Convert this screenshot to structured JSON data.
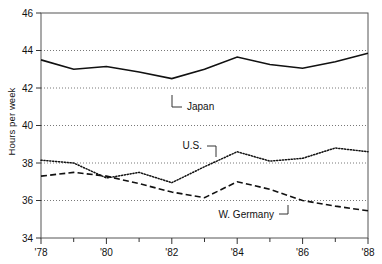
{
  "chart_data": {
    "type": "line",
    "title": "",
    "xlabel": "",
    "ylabel": "Hours per week",
    "xlim": [
      1978,
      1988
    ],
    "ylim": [
      34,
      46
    ],
    "yticks": [
      34,
      36,
      38,
      40,
      42,
      44,
      46
    ],
    "ytick_labels": [
      "34",
      "36",
      "38",
      "40",
      "42",
      "44",
      "46"
    ],
    "gridlines_y": [
      36,
      38,
      40,
      42,
      44
    ],
    "grid": "horizontal-dotted",
    "xticks": [
      1978,
      1979,
      1980,
      1981,
      1982,
      1983,
      1984,
      1985,
      1986,
      1987,
      1988
    ],
    "xtick_labels_shown": [
      "'78",
      "'80",
      "'82",
      "'84",
      "'86",
      "'88"
    ],
    "xtick_labeled_years": [
      1978,
      1980,
      1982,
      1984,
      1986,
      1988
    ],
    "legend_position": "inline-annotations",
    "series": [
      {
        "name": "Japan",
        "style": "solid",
        "x": [
          1978,
          1979,
          1980,
          1981,
          1982,
          1983,
          1984,
          1985,
          1986,
          1987,
          1988
        ],
        "values": [
          43.5,
          43.0,
          43.15,
          42.85,
          42.5,
          43.0,
          43.65,
          43.25,
          43.05,
          43.4,
          43.85
        ]
      },
      {
        "name": "U.S.",
        "style": "dotted",
        "x": [
          1978,
          1979,
          1980,
          1981,
          1982,
          1983,
          1984,
          1985,
          1986,
          1987,
          1988
        ],
        "values": [
          38.15,
          38.0,
          37.2,
          37.5,
          36.95,
          37.8,
          38.6,
          38.1,
          38.25,
          38.8,
          38.6
        ]
      },
      {
        "name": "W. Germany",
        "style": "dashed",
        "x": [
          1978,
          1979,
          1980,
          1981,
          1982,
          1983,
          1984,
          1985,
          1986,
          1987,
          1988
        ],
        "values": [
          37.3,
          37.5,
          37.3,
          36.9,
          36.45,
          36.15,
          37.0,
          36.6,
          36.0,
          35.7,
          35.45
        ]
      }
    ],
    "annotations": [
      {
        "text": "Japan",
        "series": "Japan",
        "leader": "L-up-left"
      },
      {
        "text": "U.S.",
        "series": "U.S.",
        "leader": "L-down-right"
      },
      {
        "text": "W. Germany",
        "series": "W. Germany",
        "leader": "L-up-right"
      }
    ]
  },
  "axis": {
    "y_label": "Hours per week",
    "y_tick_46": "46",
    "y_tick_44": "44",
    "y_tick_42": "42",
    "y_tick_40": "40",
    "y_tick_38": "38",
    "y_tick_36": "36",
    "y_tick_34": "34",
    "x_tick_78": "'78",
    "x_tick_80": "'80",
    "x_tick_82": "'82",
    "x_tick_84": "'84",
    "x_tick_86": "'86",
    "x_tick_88": "'88"
  },
  "labels": {
    "japan": "Japan",
    "us": "U.S.",
    "wgermany": "W. Germany"
  },
  "colors": {
    "ink": "#111111",
    "grid": "#555555",
    "background": "#ffffff"
  }
}
